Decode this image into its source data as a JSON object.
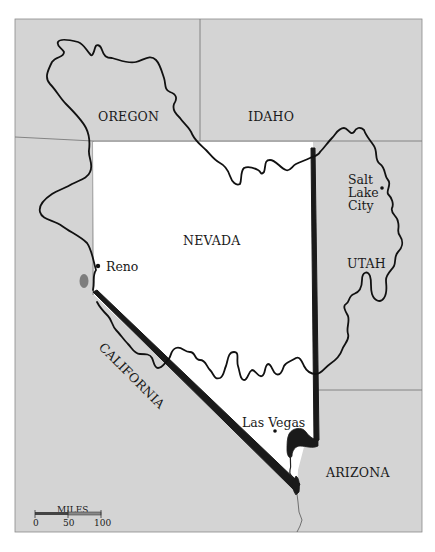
{
  "map": {
    "colors": {
      "background": "#ffffff",
      "surrounding_land": "#d4d4d4",
      "basin_interior": "#ffffff",
      "border_lines": "#7a7a7a",
      "basin_outline": "#111111",
      "nevada_boundary_heavy": "#1a1a1a",
      "lake": "#7d7d7d"
    },
    "states": {
      "oregon": "OREGON",
      "idaho": "IDAHO",
      "nevada": "NEVADA",
      "utah": "UTAH",
      "california": "CALIFORNIA",
      "arizona": "ARIZONA"
    },
    "cities": {
      "reno": "Reno",
      "salt_lake_city_1": "Salt",
      "salt_lake_city_2": "Lake",
      "salt_lake_city_3": "City",
      "las_vegas": "Las Vegas"
    },
    "scale_bar": {
      "title": "MILES",
      "ticks": [
        "0",
        "50",
        "100"
      ]
    }
  }
}
